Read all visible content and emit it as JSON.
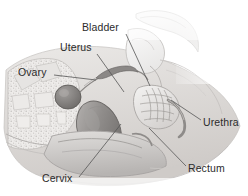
{
  "figure": {
    "kind": "anatomical-illustration",
    "view": "sagittal cross-section",
    "style": "grayscale medical line-and-wash drawing",
    "background_color": "#ffffff",
    "label_color": "#2b2b2b",
    "leader_line_color": "#555555",
    "tissue_tones": {
      "bone_light": "#f2f2f2",
      "bone_outline": "#b9b9b9",
      "soft_tissue": "#e3e1df",
      "soft_tissue_mid": "#cfcccb",
      "organ_dark": "#8d8a88",
      "organ_darkest": "#6f6c6a",
      "cavity": "#9a9795",
      "trabecular": "#dedcda"
    }
  },
  "labels": [
    {
      "id": "bladder",
      "text": "Bladder",
      "x": 82,
      "y": 22,
      "leader": {
        "x1": 126,
        "y1": 34,
        "x2": 150,
        "y2": 86
      }
    },
    {
      "id": "uterus",
      "text": "Uterus",
      "x": 60,
      "y": 42,
      "leader": {
        "x1": 97,
        "y1": 54,
        "x2": 124,
        "y2": 92
      }
    },
    {
      "id": "ovary",
      "text": "Ovary",
      "x": 18,
      "y": 67,
      "leader": {
        "x1": 54,
        "y1": 75,
        "x2": 96,
        "y2": 80
      }
    },
    {
      "id": "urethra",
      "text": "Urethra",
      "x": 203,
      "y": 117,
      "leader": {
        "x1": 201,
        "y1": 120,
        "x2": 171,
        "y2": 100
      }
    },
    {
      "id": "rectum",
      "text": "Rectum",
      "x": 188,
      "y": 163,
      "leader": {
        "x1": 186,
        "y1": 166,
        "x2": 149,
        "y2": 128
      }
    },
    {
      "id": "cervix",
      "text": "Cervix",
      "x": 42,
      "y": 173,
      "leader": {
        "x1": 79,
        "y1": 177,
        "x2": 121,
        "y2": 124
      }
    }
  ]
}
